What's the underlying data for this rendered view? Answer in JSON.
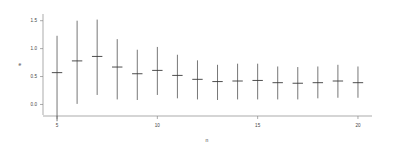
{
  "chart_data": {
    "type": "scatter",
    "title": "",
    "subtitle": "",
    "xlabel": "n",
    "ylabel": "e",
    "xlim": [
      4.3,
      20.7
    ],
    "ylim": [
      -0.35,
      1.62
    ],
    "grid": false,
    "legend": null,
    "x_ticks": [
      5,
      10,
      15,
      20
    ],
    "x_tick_labels": [
      "5",
      "10",
      "15",
      "20"
    ],
    "y_ticks": [
      0.0,
      0.5,
      1.0,
      1.5
    ],
    "y_tick_labels": [
      "0.0",
      "0.5",
      "1.0",
      "1.5"
    ],
    "marker": "horizontal-dash",
    "errorbar_style": "vertical-line-no-caps",
    "x": [
      5,
      6,
      7,
      8,
      9,
      10,
      11,
      12,
      13,
      14,
      15,
      16,
      17,
      18,
      19,
      20
    ],
    "series": [
      {
        "name": "e",
        "values": [
          0.57,
          0.78,
          0.86,
          0.67,
          0.55,
          0.61,
          0.52,
          0.45,
          0.41,
          0.42,
          0.43,
          0.39,
          0.38,
          0.39,
          0.42,
          0.39
        ],
        "lower": [
          -0.3,
          0.01,
          0.17,
          0.09,
          0.08,
          0.17,
          0.11,
          0.09,
          0.08,
          0.09,
          0.09,
          0.09,
          0.09,
          0.11,
          0.12,
          0.12
        ],
        "upper": [
          1.23,
          1.5,
          1.52,
          1.17,
          0.98,
          1.03,
          0.89,
          0.79,
          0.71,
          0.73,
          0.73,
          0.68,
          0.67,
          0.68,
          0.71,
          0.68
        ]
      }
    ]
  },
  "figure": {
    "background_color": "#ffffff",
    "axis_color": "#888888",
    "data_color": "#4a4a4a",
    "text_color": "#444444"
  }
}
